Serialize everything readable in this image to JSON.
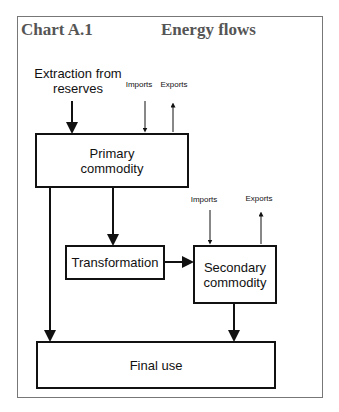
{
  "header": {
    "chart_label": "Chart A.1",
    "title": "Energy flows"
  },
  "nodes": {
    "extraction": "Extraction from reserves",
    "primary_line1": "Primary",
    "primary_line2": "commodity",
    "transformation": "Transformation",
    "secondary_line1": "Secondary",
    "secondary_line2": "commodity",
    "final_use": "Final use"
  },
  "flows": {
    "primary_imports": "Imports",
    "primary_exports": "Exports",
    "secondary_imports": "Imports",
    "secondary_exports": "Exports"
  }
}
